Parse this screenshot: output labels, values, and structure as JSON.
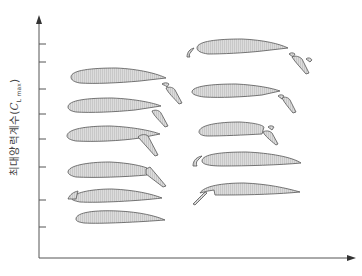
{
  "diagram": {
    "type": "airfoil-high-lift-devices-comparison",
    "y_axis": {
      "label_prefix": "최대양력계수(",
      "label_symbol": "C",
      "label_sub": "L max",
      "label_suffix": ")",
      "ticks": 8
    },
    "x_axis": {
      "label": ""
    },
    "colors": {
      "stroke": "#555555",
      "fill": "#d4d4d4",
      "axis": "#555555"
    },
    "airfoils": [
      {
        "column": "left",
        "row": 1,
        "device": "plain airfoil"
      },
      {
        "column": "left",
        "row": 2,
        "device": "leading-edge flap"
      },
      {
        "column": "left",
        "row": 3,
        "device": "plain flap"
      },
      {
        "column": "left",
        "row": 4,
        "device": "split flap"
      },
      {
        "column": "left",
        "row": 5,
        "device": "slotted flap"
      },
      {
        "column": "left",
        "row": 6,
        "device": "double slotted flap"
      },
      {
        "column": "right",
        "row": 1,
        "device": "Krueger flap"
      },
      {
        "column": "right",
        "row": 2,
        "device": "leading-edge slat"
      },
      {
        "column": "right",
        "row": 3,
        "device": "Fowler flap"
      },
      {
        "column": "right",
        "row": 4,
        "device": "slotted flap with slat"
      },
      {
        "column": "right",
        "row": 5,
        "device": "triple slotted flap with slat"
      }
    ]
  }
}
